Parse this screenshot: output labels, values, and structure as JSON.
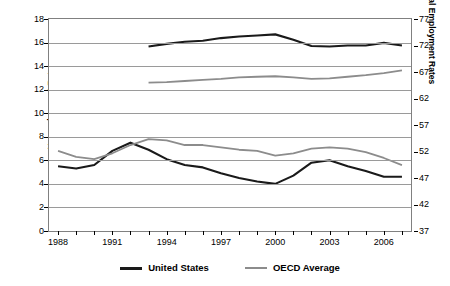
{
  "chart_data": {
    "type": "line",
    "title": "",
    "xlabel": "",
    "ylabel": "Unemployment Rates as % of Civilian Labor Force",
    "ylabel_line1": "Unemployment Rates",
    "ylabel_line2": "as % of Civilian Labor Force",
    "y2label": "Total Employment Rates",
    "grid": true,
    "legend_position": "bottom",
    "x": [
      1988,
      1989,
      1990,
      1991,
      1992,
      1993,
      1994,
      1995,
      1996,
      1997,
      1998,
      1999,
      2000,
      2001,
      2002,
      2003,
      2004,
      2005,
      2006,
      2007
    ],
    "xlim": [
      1987.5,
      2007.5
    ],
    "xtick_labels": [
      "1988",
      "1991",
      "1994",
      "1997",
      "2000",
      "2003",
      "2006"
    ],
    "xtick_values": [
      1988,
      1991,
      1994,
      1997,
      2000,
      2003,
      2006
    ],
    "ylim": [
      0,
      18
    ],
    "ytick_labels": [
      "0",
      "2",
      "4",
      "6",
      "8",
      "10",
      "12",
      "14",
      "16",
      "18"
    ],
    "ytick_values": [
      0,
      2,
      4,
      6,
      8,
      10,
      12,
      14,
      16,
      18
    ],
    "y2lim": [
      37,
      77
    ],
    "y2tick_labels": [
      "37",
      "42",
      "47",
      "52",
      "57",
      "62",
      "67",
      "72",
      "77"
    ],
    "y2tick_values": [
      37,
      42,
      47,
      52,
      57,
      62,
      67,
      72,
      77
    ],
    "series": [
      {
        "name": "United States",
        "axis": "left",
        "color": "#1a1a1a",
        "measure": "Unemployment Rate",
        "x": [
          1988,
          1989,
          1990,
          1991,
          1992,
          1993,
          1994,
          1995,
          1996,
          1997,
          1998,
          1999,
          2000,
          2001,
          2002,
          2003,
          2004,
          2005,
          2006,
          2007
        ],
        "values": [
          5.5,
          5.3,
          5.6,
          6.8,
          7.5,
          6.9,
          6.1,
          5.6,
          5.4,
          4.9,
          4.5,
          4.2,
          4.0,
          4.7,
          5.8,
          6.0,
          5.5,
          5.1,
          4.6,
          4.6
        ]
      },
      {
        "name": "OECD Average",
        "axis": "left",
        "color": "#8c8c8c",
        "measure": "Unemployment Rate",
        "x": [
          1988,
          1989,
          1990,
          1991,
          1992,
          1993,
          1994,
          1995,
          1996,
          1997,
          1998,
          1999,
          2000,
          2001,
          2002,
          2003,
          2004,
          2005,
          2006,
          2007
        ],
        "values": [
          6.8,
          6.3,
          6.1,
          6.6,
          7.3,
          7.8,
          7.7,
          7.3,
          7.3,
          7.1,
          6.9,
          6.8,
          6.4,
          6.6,
          7.0,
          7.1,
          7.0,
          6.7,
          6.2,
          5.6
        ]
      },
      {
        "name": "United States",
        "axis": "right",
        "color": "#1a1a1a",
        "measure": "Total Employment Rate",
        "x": [
          1993,
          1994,
          1995,
          1996,
          1997,
          1998,
          1999,
          2000,
          2001,
          2002,
          2003,
          2004,
          2005,
          2006,
          2007
        ],
        "values": [
          71.8,
          72.3,
          72.7,
          72.9,
          73.4,
          73.7,
          73.9,
          74.1,
          73.1,
          71.9,
          71.8,
          72.0,
          72.0,
          72.5,
          72.0
        ]
      },
      {
        "name": "OECD Average",
        "axis": "right",
        "color": "#8c8c8c",
        "measure": "Total Employment Rate",
        "x": [
          1993,
          1994,
          1995,
          1996,
          1997,
          1998,
          1999,
          2000,
          2001,
          2002,
          2003,
          2004,
          2005,
          2006,
          2007
        ],
        "values": [
          65.0,
          65.1,
          65.3,
          65.5,
          65.7,
          66.0,
          66.1,
          66.2,
          66.0,
          65.7,
          65.8,
          66.1,
          66.4,
          66.8,
          67.3
        ]
      }
    ]
  },
  "legend": {
    "items": [
      {
        "label": "United States",
        "color": "#1a1a1a"
      },
      {
        "label": "OECD Average",
        "color": "#8c8c8c"
      }
    ]
  }
}
